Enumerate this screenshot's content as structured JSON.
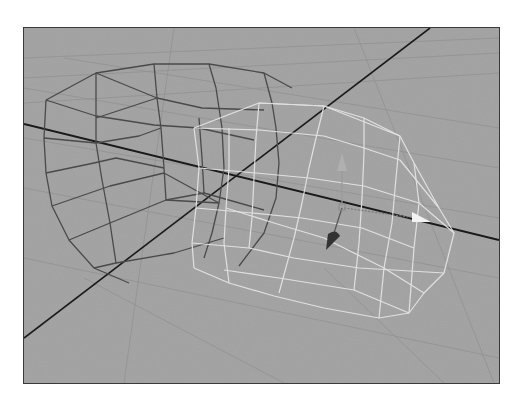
{
  "viewport": {
    "type": "3d-perspective-viewport",
    "background_color": "#a6a6a6",
    "grid_line_color": "#8f8f8f",
    "axis_line_color": "#1a1a1a",
    "objects": [
      {
        "name": "unselected-mesh",
        "wire_color": "#4a4a4a",
        "selected": false
      },
      {
        "name": "selected-mesh",
        "wire_color": "#e4e4e4",
        "selected": true
      }
    ],
    "manipulator": {
      "type": "move",
      "x_arrow_color": "#f2f2f2",
      "y_arrow_color": "#a0a0a0",
      "z_arrow_color": "#333333"
    }
  }
}
